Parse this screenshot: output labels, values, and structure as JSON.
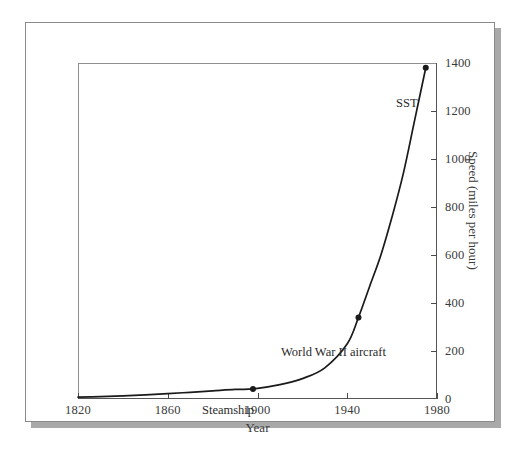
{
  "chart_data": {
    "type": "line",
    "title": "",
    "subtitle": "",
    "xlabel": "Year",
    "ylabel": "Speed (miles per hour)",
    "xlim": [
      1820,
      1980
    ],
    "ylim": [
      0,
      1400
    ],
    "xticks": [
      1820,
      1860,
      1900,
      1940,
      1980
    ],
    "xtick_labels": [
      "1820",
      "1860",
      "1900",
      "1940",
      "1980"
    ],
    "yticks": [
      0,
      200,
      400,
      600,
      800,
      1000,
      1200,
      1400
    ],
    "ytick_labels": [
      "0",
      "200",
      "400",
      "600",
      "800",
      "1000",
      "1200",
      "1400"
    ],
    "y_axis_position": "right",
    "x_axis_position": "bottom",
    "grid": false,
    "legend": false,
    "legend_position": "none",
    "line_color": "#1a1a1a",
    "marker_color": "#1a1a1a",
    "series": [
      {
        "name": "Maximum speed of transportation",
        "x": [
          1820,
          1830,
          1840,
          1850,
          1860,
          1870,
          1880,
          1890,
          1898,
          1910,
          1920,
          1930,
          1940,
          1945,
          1950,
          1955,
          1960,
          1965,
          1970,
          1975
        ],
        "values": [
          8,
          10,
          13,
          17,
          22,
          28,
          34,
          40,
          42,
          60,
          85,
          130,
          230,
          340,
          470,
          600,
          760,
          940,
          1160,
          1380
        ]
      }
    ],
    "annotations": [
      {
        "label": "Steamship",
        "x": 1898,
        "y": 42,
        "marker": true,
        "text_anchor": "right-of-label"
      },
      {
        "label": "World War II aircraft",
        "x": 1945,
        "y": 340,
        "marker": true,
        "text_anchor": "right-of-label"
      },
      {
        "label": "SST",
        "x": 1975,
        "y": 1380,
        "marker": true,
        "text_anchor": "right-of-label"
      }
    ]
  },
  "axes": {
    "xlabel": "Year",
    "ylabel": "Speed (miles per hour)"
  },
  "ticks": {
    "x": [
      "1820",
      "1860",
      "1900",
      "1940",
      "1980"
    ],
    "y": [
      "0",
      "200",
      "400",
      "600",
      "800",
      "1000",
      "1200",
      "1400"
    ]
  },
  "annotations": {
    "sst": "SST",
    "wwii": "World War II aircraft",
    "steamship": "Steamship"
  },
  "colors": {
    "curve": "#1a1a1a",
    "frame": "#8f8f8f",
    "card_border": "#8a8a8a",
    "shadow": "#a9a9a9",
    "text": "#3a3a3a",
    "background": "#ffffff"
  }
}
